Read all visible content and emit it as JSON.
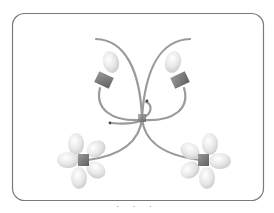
{
  "diagram": {
    "type": "molecular-schematic",
    "frame": {
      "x": 12,
      "y": 13,
      "width": 251,
      "height": 187,
      "radius": 12,
      "stroke": "#7a7a7a"
    },
    "colors": {
      "strand": "#9a9a9a",
      "block": "#7d7d7d",
      "lobe": "#e4e4e4",
      "arrow": "#444444",
      "frame": "#7a7a7a"
    },
    "units": [
      {
        "id": "upper-left",
        "kind": "single-lobe",
        "block": {
          "cx": 104,
          "cy": 80,
          "angle": 25
        },
        "lobes": 1
      },
      {
        "id": "upper-right",
        "kind": "single-lobe",
        "block": {
          "cx": 180,
          "cy": 80,
          "angle": -25
        },
        "lobes": 1
      },
      {
        "id": "lower-left",
        "kind": "four-lobe",
        "block": {
          "cx": 83,
          "cy": 160
        },
        "lobes": 4
      },
      {
        "id": "lower-right",
        "kind": "four-lobe",
        "block": {
          "cx": 204,
          "cy": 160
        },
        "lobes": 4
      }
    ],
    "junction": {
      "cx": 142,
      "cy": 118
    },
    "arrows": [
      {
        "id": "arrow-upper",
        "x": 147,
        "y": 101
      },
      {
        "id": "arrow-left",
        "x": 110,
        "y": 123
      }
    ],
    "caption_fragment": "· ·   ·"
  }
}
